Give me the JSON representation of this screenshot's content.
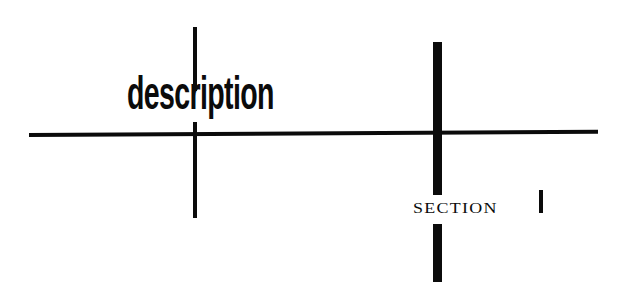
{
  "graphic": {
    "primary_label": "description",
    "secondary_label": "SECTION",
    "ink_color": "#0b0b0b",
    "background_color": "#ffffff"
  }
}
